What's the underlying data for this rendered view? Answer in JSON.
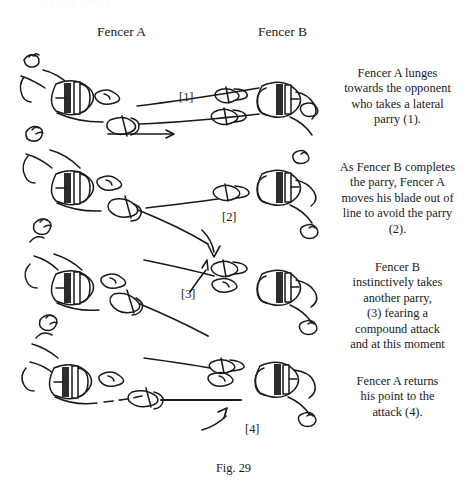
{
  "figure": {
    "number_label": "Fig. 29",
    "clipped_heading": "FENCING",
    "columns": [
      {
        "label": "Fencer A"
      },
      {
        "label": "Fencer B"
      }
    ],
    "panels": [
      {
        "step_label": "[1]",
        "arrow": "down-arrow",
        "caption_lines": [
          "Fencer A lunges",
          "towards the opponent",
          "who takes a lateral",
          "parry (1)."
        ]
      },
      {
        "step_label": "[2]",
        "arrow": "curved-down-arrow",
        "caption_lines": [
          "As Fencer B completes",
          "the parry, Fencer A",
          "moves his blade out of",
          "line to avoid the parry",
          "(2)."
        ]
      },
      {
        "step_label": "[3]",
        "arrow": "up-arrow",
        "caption_lines": [
          "Fencer B",
          "instinctively takes",
          "another parry,",
          "(3) fearing a",
          "compound attack",
          "and at this moment"
        ]
      },
      {
        "step_label": "[4]",
        "arrow": "curved-up-arrow",
        "caption_lines": [
          "Fencer A returns",
          "his point to the",
          "attack (4)."
        ]
      }
    ],
    "colors": {
      "ink": "#1a1a1a",
      "background": "#ffffff"
    }
  }
}
